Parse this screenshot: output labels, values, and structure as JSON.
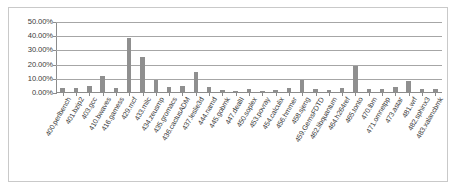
{
  "chart_data": {
    "type": "bar",
    "title": "",
    "subtitle": "",
    "xlabel": "",
    "ylabel": "",
    "ylim": [
      0,
      50
    ],
    "yunit": "%",
    "grid": true,
    "legend": false,
    "legend_position": "none",
    "ytick_labels": [
      "50.00%",
      "40.00%",
      "30.00%",
      "20.00%",
      "10.00%",
      "0.00%"
    ],
    "ytick_values": [
      50,
      40,
      30,
      20,
      10,
      0
    ],
    "categories": [
      "400.perlbench",
      "401.bzip2",
      "403.gcc",
      "410.bwaves",
      "416.gamess",
      "429.mcf",
      "433.milc",
      "434.zeusmp",
      "435.gromacs",
      "436.cactusADM",
      "437.leslie3d",
      "444.namd",
      "445.gobmk",
      "447.dealII",
      "450.soplex",
      "453.povray",
      "454.calculix",
      "456.hmmer",
      "458.sjeng",
      "459.GemsFDTD",
      "462.libquantum",
      "464.h264ref",
      "465.tonto",
      "470.lbm",
      "471.omnetpp",
      "473.astar",
      "481.wrf",
      "482.sphinx3",
      "483.xalancbmk"
    ],
    "values": [
      3.0,
      2.5,
      4.5,
      11.0,
      2.8,
      38.0,
      24.5,
      8.5,
      3.5,
      4.5,
      14.0,
      3.5,
      1.5,
      1.0,
      2.0,
      0.4,
      1.2,
      3.0,
      8.5,
      2.0,
      1.5,
      2.5,
      18.5,
      2.0,
      2.0,
      3.5,
      8.0,
      2.0,
      2.0
    ],
    "bar_color": "#8f8f8f",
    "grid_color": "#a6a6a6",
    "background": "#ffffff"
  }
}
